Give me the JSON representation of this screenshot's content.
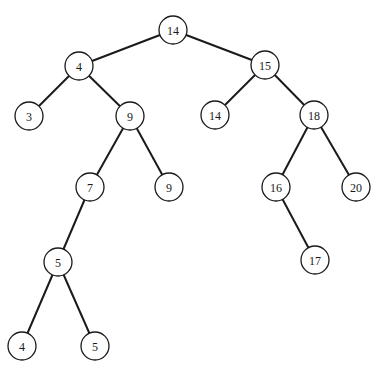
{
  "diagram": {
    "type": "binary-tree",
    "node_radius": 14,
    "nodes": [
      {
        "id": "n14root",
        "label": "14",
        "x": 173,
        "y": 30
      },
      {
        "id": "n4",
        "label": "4",
        "x": 79,
        "y": 66
      },
      {
        "id": "n15",
        "label": "15",
        "x": 265,
        "y": 65
      },
      {
        "id": "n3",
        "label": "3",
        "x": 29,
        "y": 116
      },
      {
        "id": "n9a",
        "label": "9",
        "x": 130,
        "y": 116
      },
      {
        "id": "n14b",
        "label": "14",
        "x": 215,
        "y": 115
      },
      {
        "id": "n18",
        "label": "18",
        "x": 314,
        "y": 115
      },
      {
        "id": "n7",
        "label": "7",
        "x": 90,
        "y": 187
      },
      {
        "id": "n9b",
        "label": "9",
        "x": 169,
        "y": 187
      },
      {
        "id": "n16",
        "label": "16",
        "x": 276,
        "y": 187
      },
      {
        "id": "n20",
        "label": "20",
        "x": 356,
        "y": 187
      },
      {
        "id": "n5a",
        "label": "5",
        "x": 58,
        "y": 262
      },
      {
        "id": "n17",
        "label": "17",
        "x": 315,
        "y": 260
      },
      {
        "id": "n4b",
        "label": "4",
        "x": 22,
        "y": 346
      },
      {
        "id": "n5b",
        "label": "5",
        "x": 95,
        "y": 346
      }
    ],
    "edges": [
      [
        "n14root",
        "n4"
      ],
      [
        "n14root",
        "n15"
      ],
      [
        "n4",
        "n3"
      ],
      [
        "n4",
        "n9a"
      ],
      [
        "n15",
        "n14b"
      ],
      [
        "n15",
        "n18"
      ],
      [
        "n9a",
        "n7"
      ],
      [
        "n9a",
        "n9b"
      ],
      [
        "n18",
        "n16"
      ],
      [
        "n18",
        "n20"
      ],
      [
        "n7",
        "n5a"
      ],
      [
        "n16",
        "n17"
      ],
      [
        "n5a",
        "n4b"
      ],
      [
        "n5a",
        "n5b"
      ]
    ]
  }
}
